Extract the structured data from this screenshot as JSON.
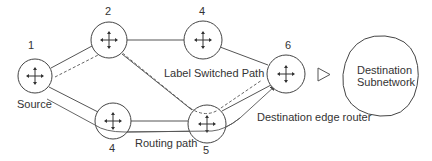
{
  "diagram": {
    "nodes": [
      {
        "id": "1",
        "label": "1",
        "role": "Source",
        "icon": "router-icon"
      },
      {
        "id": "2",
        "label": "2",
        "icon": "router-icon"
      },
      {
        "id": "4top",
        "label": "4",
        "icon": "router-icon"
      },
      {
        "id": "6",
        "label": "6",
        "role": "Destination edge router",
        "icon": "router-icon"
      },
      {
        "id": "4bot",
        "label": "4",
        "icon": "router-icon"
      },
      {
        "id": "5",
        "label": "5",
        "icon": "router-icon"
      }
    ],
    "labels": {
      "source": "Source",
      "label_switched_path": "Label Switched Path",
      "routing_path": "Routing path",
      "destination_edge_router": "Destination edge router",
      "destination_subnetwork_line1": "Destination",
      "destination_subnetwork_line2": "Subnetwork"
    },
    "edges": [
      {
        "from": "1",
        "to": "2",
        "style": "solid"
      },
      {
        "from": "2",
        "to": "4top",
        "style": "solid"
      },
      {
        "from": "4top",
        "to": "6",
        "style": "solid"
      },
      {
        "from": "2",
        "to": "5",
        "style": "solid"
      },
      {
        "from": "1",
        "to": "4bot",
        "style": "solid"
      },
      {
        "from": "4bot",
        "to": "5",
        "style": "solid"
      },
      {
        "from": "5",
        "to": "6",
        "style": "solid"
      },
      {
        "from": "1",
        "to": "6",
        "via": [
          "2",
          "5"
        ],
        "style": "dashed",
        "name": "Label Switched Path"
      },
      {
        "from": "1",
        "to": "6",
        "via": [
          "4",
          "5"
        ],
        "style": "solid-arrow",
        "name": "Routing path"
      }
    ],
    "colors": {
      "stroke": "#444444",
      "text": "#333333",
      "background": "#ffffff"
    }
  }
}
